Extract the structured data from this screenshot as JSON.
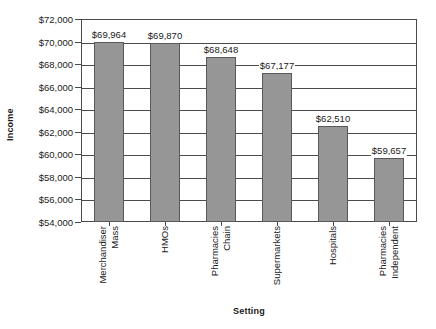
{
  "chart_data": {
    "type": "bar",
    "title": "",
    "xlabel": "Setting",
    "ylabel": "Income",
    "categories": [
      "Mass Merchandiser",
      "HMOs",
      "Chain Pharmacies",
      "Supermarkets",
      "Hospitals",
      "Independent Pharmacies"
    ],
    "category_lines": [
      [
        "Mass",
        "Merchandiser"
      ],
      [
        "HMOs"
      ],
      [
        "Chain",
        "Pharmacies"
      ],
      [
        "Supermarkets"
      ],
      [
        "Hospitals"
      ],
      [
        "Independent",
        "Pharmacies"
      ]
    ],
    "values": [
      69964,
      69870,
      68648,
      67177,
      62510,
      59657
    ],
    "value_labels": [
      "$69,964",
      "$69,870",
      "$68,648",
      "$67,177",
      "$62,510",
      "$59,657"
    ],
    "ylim": [
      54000,
      72000
    ],
    "ytick_values": [
      54000,
      56000,
      58000,
      60000,
      62000,
      64000,
      66000,
      68000,
      70000,
      72000
    ],
    "ytick_labels": [
      "$54,000",
      "$56,000",
      "$58,000",
      "$60,000",
      "$62,000",
      "$64,000",
      "$66,000",
      "$68,000",
      "$70,000",
      "$72,000"
    ],
    "grid": true,
    "legend": false,
    "bar_color": "#969696",
    "bar_edge_color": "#59595b",
    "axis_color": "#4a4a4a",
    "text_color": "#1a1a1a",
    "background": "#ffffff"
  }
}
